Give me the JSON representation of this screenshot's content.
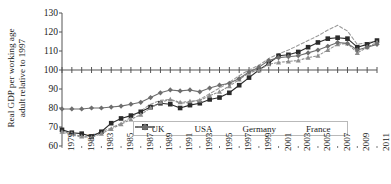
{
  "chart_data": {
    "type": "line",
    "title": "",
    "xlabel": "",
    "ylabel": "Real GDP per working age\nadult relative to 1997",
    "ylim": [
      60,
      130
    ],
    "yticks": [
      60,
      70,
      80,
      90,
      100,
      110,
      120,
      130
    ],
    "xlim": [
      1979,
      2011
    ],
    "x": [
      1979,
      1980,
      1981,
      1982,
      1983,
      1984,
      1985,
      1986,
      1987,
      1988,
      1989,
      1990,
      1991,
      1992,
      1993,
      1994,
      1995,
      1996,
      1997,
      1998,
      1999,
      2000,
      2001,
      2002,
      2003,
      2004,
      2005,
      2006,
      2007,
      2008,
      2009,
      2010,
      2011
    ],
    "xticks": [
      1979,
      1981,
      1983,
      1985,
      1987,
      1989,
      1991,
      1993,
      1995,
      1997,
      1999,
      2001,
      2003,
      2005,
      2007,
      2009,
      2011
    ],
    "xtick_labels": [
      "1979",
      "1981",
      "1983",
      "1985",
      "1987",
      "1989",
      "1991",
      "1993",
      "1995",
      "1997",
      "1999",
      "2001",
      "2003",
      "2005",
      "2007",
      "2009",
      "2011"
    ],
    "grid": false,
    "axis_crosses_y_at": 100,
    "legend_position": "bottom-center",
    "series": [
      {
        "name": "UK",
        "color": "#9a9a9a",
        "style": "dashed",
        "marker": "none",
        "values": [
          67.0,
          66.0,
          64.5,
          65.5,
          67.5,
          69.5,
          72.0,
          75.0,
          78.5,
          82.0,
          84.0,
          84.5,
          82.5,
          83.0,
          84.5,
          87.5,
          90.5,
          93.5,
          97.0,
          100.0,
          102.5,
          106.0,
          108.5,
          110.5,
          113.0,
          115.5,
          118.0,
          121.0,
          123.5,
          120.5,
          113.5,
          114.5,
          115.0
        ]
      },
      {
        "name": "USA",
        "color": "#2b2b2b",
        "style": "solid",
        "marker": "square",
        "values": [
          68.5,
          67.0,
          66.5,
          65.0,
          67.5,
          72.0,
          74.5,
          76.0,
          78.0,
          80.5,
          82.5,
          82.0,
          80.0,
          81.5,
          82.5,
          84.5,
          85.5,
          88.0,
          92.0,
          96.0,
          100.0,
          103.5,
          107.5,
          108.0,
          109.5,
          112.0,
          114.5,
          116.5,
          117.0,
          116.5,
          112.0,
          113.5,
          115.5
        ]
      },
      {
        "name": "Germany",
        "color": "#8d8d8d",
        "style": "dotted",
        "marker": "triangle",
        "values": [
          67.5,
          66.5,
          65.0,
          64.5,
          66.5,
          69.0,
          71.5,
          74.0,
          76.5,
          80.0,
          83.0,
          84.5,
          83.0,
          83.5,
          84.0,
          86.5,
          88.5,
          91.5,
          95.0,
          98.5,
          100.0,
          103.0,
          104.0,
          104.5,
          105.0,
          106.5,
          107.5,
          110.5,
          113.5,
          114.0,
          109.0,
          112.0,
          114.5
        ]
      },
      {
        "name": "France",
        "color": "#6e6e6e",
        "style": "solid",
        "marker": "diamond",
        "values": [
          79.5,
          79.5,
          79.5,
          80.0,
          80.0,
          80.5,
          81.0,
          82.0,
          83.0,
          85.5,
          88.0,
          89.5,
          89.0,
          89.5,
          88.5,
          90.5,
          92.0,
          93.0,
          95.5,
          99.0,
          101.5,
          105.0,
          106.5,
          107.0,
          107.5,
          109.0,
          110.5,
          112.5,
          114.5,
          114.0,
          110.5,
          112.0,
          113.5
        ]
      }
    ]
  },
  "legend": {
    "items": [
      {
        "label": "UK"
      },
      {
        "label": "USA"
      },
      {
        "label": "Germany"
      },
      {
        "label": "France"
      }
    ]
  }
}
